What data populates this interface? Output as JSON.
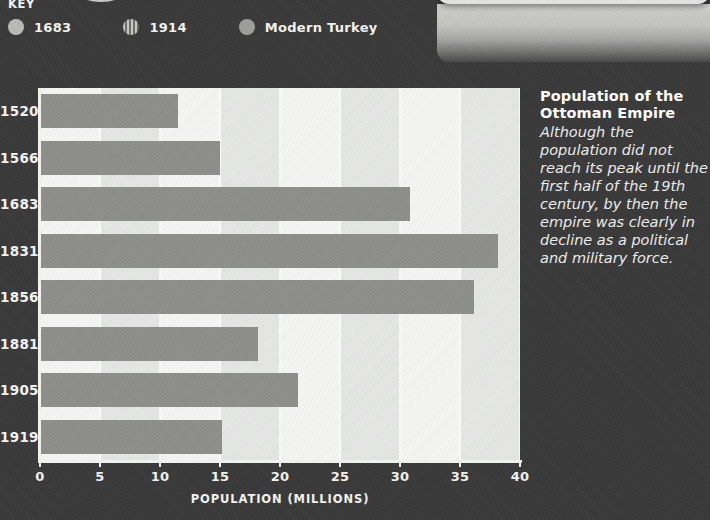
{
  "top_card": {
    "text": "sophisticated state."
  },
  "key": {
    "title": "KEY",
    "items": [
      {
        "label": "1683",
        "swatch": "solid-circle-icon",
        "color": "#b9b9b6"
      },
      {
        "label": "1914",
        "swatch": "striped-circle-icon",
        "color": "#8e8e8b"
      },
      {
        "label": "Modern Turkey",
        "swatch": "solid-circle-icon",
        "color": "#9d9d9a"
      }
    ]
  },
  "side_panel": {
    "title": "Population of the Ottoman Empire",
    "body": "Although the population did not reach its peak until the first half of the 19th century, by then the empire  was clearly in decline as a political and military force."
  },
  "chart_data": {
    "type": "bar",
    "orientation": "horizontal",
    "title": "Population of the Ottoman Empire",
    "categories": [
      "1520",
      "1566",
      "1683",
      "1831",
      "1856",
      "1881",
      "1905",
      "1919"
    ],
    "values": [
      11.5,
      15.0,
      30.8,
      38.2,
      36.2,
      18.2,
      21.5,
      15.2
    ],
    "xlabel": "POPULATION (MILLIONS)",
    "ylabel": "",
    "xlim": [
      0,
      40
    ],
    "xticks": [
      0,
      5,
      10,
      15,
      20,
      25,
      30,
      35,
      40
    ],
    "grid": true,
    "legend": false,
    "bar_color": "#8e8e8b",
    "plot_background": "#eef0ec",
    "page_background": "#3a3a3a"
  }
}
